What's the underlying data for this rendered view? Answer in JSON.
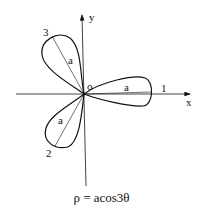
{
  "diagram": {
    "equation": "ρ = acos3θ",
    "axes": {
      "x_label": "x",
      "y_label": "y",
      "origin_label": "o"
    },
    "petals": [
      {
        "number": "1",
        "radius_label": "a",
        "angle_deg": 0
      },
      {
        "number": "2",
        "radius_label": "a",
        "angle_deg": 240
      },
      {
        "number": "3",
        "radius_label": "a",
        "angle_deg": 120
      }
    ],
    "colors": {
      "stroke": "#111111",
      "background": "#ffffff"
    }
  }
}
